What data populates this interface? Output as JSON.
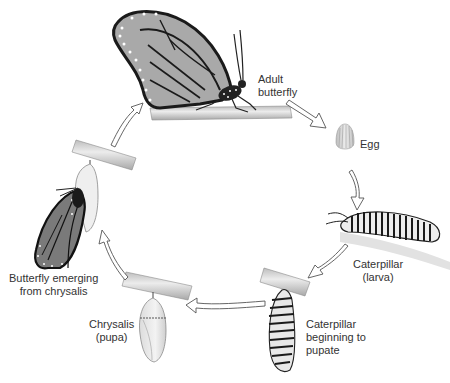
{
  "diagram": {
    "type": "life-cycle",
    "subject": "butterfly",
    "stages": [
      {
        "id": "adult",
        "label": "Adult\nbutterfly"
      },
      {
        "id": "egg",
        "label": "Egg"
      },
      {
        "id": "larva",
        "label": "Caterpillar\n(larva)"
      },
      {
        "id": "pre-pupa",
        "label": "Caterpillar\nbeginning to\npupate"
      },
      {
        "id": "pupa",
        "label": "Chrysalis\n(pupa)"
      },
      {
        "id": "emerging",
        "label": "Butterfly emerging\nfrom chrysalis"
      }
    ],
    "arrows": [
      {
        "from": "adult",
        "to": "egg"
      },
      {
        "from": "egg",
        "to": "larva"
      },
      {
        "from": "larva",
        "to": "pre-pupa"
      },
      {
        "from": "pre-pupa",
        "to": "pupa"
      },
      {
        "from": "pupa",
        "to": "emerging"
      },
      {
        "from": "emerging",
        "to": "adult"
      }
    ],
    "colors": {
      "wing_fill": "#a9a9a9",
      "wing_outline": "#1a1a1a",
      "branch": "#d8d8d8",
      "arrow_fill": "#ffffff",
      "arrow_stroke": "#555555",
      "text": "#333333"
    }
  }
}
